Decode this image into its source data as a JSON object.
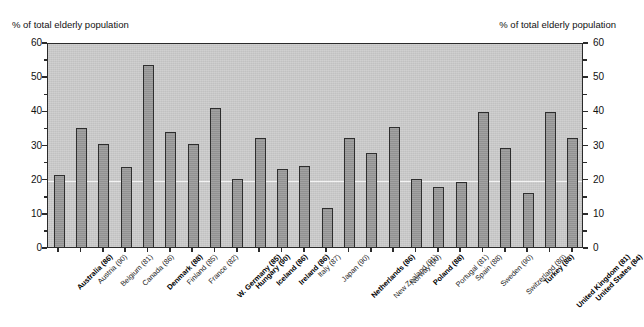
{
  "figure": {
    "left_axis_caption": "% of total elderly population",
    "right_axis_caption": "% of total elderly population"
  },
  "chart_data": {
    "type": "bar",
    "title": "",
    "subtitle": "",
    "xlabel": "",
    "ylabel": "% of total elderly population",
    "ylabel_right": "% of total elderly population",
    "ylim": [
      0,
      60
    ],
    "ytick_labels": [
      "0",
      "10",
      "20",
      "30",
      "40",
      "50",
      "60"
    ],
    "ytick_values": [
      0,
      10,
      20,
      30,
      40,
      50,
      60
    ],
    "minor_tick_values": [
      5,
      15,
      25,
      35,
      45,
      55
    ],
    "gridlines": [
      20
    ],
    "grid": true,
    "legend": "none",
    "bar_color": "#9a9a9a",
    "bar_edge_color": "#2e2e2e",
    "plot_background": "#cccccc",
    "categories": [
      "Australia (86)",
      "Austria (90)",
      "Belgium (81)",
      "Canada (86)",
      "Denmark (88)",
      "Finland (85)",
      "France (82)",
      "W. Germany (85)",
      "Hungary (90)",
      "Iceland (86)",
      "Ireland (86)",
      "Italy (87)",
      "Japan (90)",
      "Netherlands (86)",
      "New Zealand (91)",
      "Norway (90)",
      "Poland (88)",
      "Portugal (81)",
      "Spain (88)",
      "Sweden (90)",
      "Switzerland (80)",
      "Turkey (88)",
      "United Kingdom (81)",
      "United States (84)"
    ],
    "category_emphasis": [
      true,
      false,
      false,
      false,
      true,
      false,
      false,
      true,
      true,
      true,
      true,
      false,
      false,
      true,
      false,
      false,
      true,
      false,
      false,
      false,
      false,
      true,
      true,
      true
    ],
    "values": [
      21.0,
      34.7,
      30.1,
      23.5,
      53.2,
      33.8,
      30.1,
      40.8,
      19.9,
      31.9,
      22.9,
      23.8,
      11.4,
      31.9,
      27.6,
      35.0,
      20.0,
      17.5,
      19.1,
      39.5,
      29.0,
      15.8,
      39.5,
      32.0
    ]
  }
}
